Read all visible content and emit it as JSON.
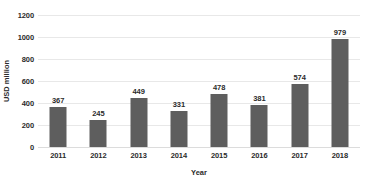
{
  "chart_data": {
    "type": "bar",
    "title": "",
    "subtitle": "",
    "xlabel": "Year",
    "ylabel": "USD million",
    "categories": [
      "2011",
      "2012",
      "2013",
      "2014",
      "2015",
      "2016",
      "2017",
      "2018"
    ],
    "values": [
      367,
      245,
      449,
      331,
      478,
      381,
      574,
      979
    ],
    "data_labels": [
      "367",
      "245",
      "449",
      "331",
      "478",
      "381",
      "574",
      "979"
    ],
    "ylim": [
      0,
      1200
    ],
    "yticks": [
      0,
      200,
      400,
      600,
      800,
      1000,
      1200
    ],
    "ytick_labels": [
      "0",
      "200",
      "400",
      "600",
      "800",
      "1000",
      "1200"
    ],
    "grid": "horizontal",
    "legend": "none",
    "series": [
      {
        "name": "USD million",
        "values": [
          367,
          245,
          449,
          331,
          478,
          381,
          574,
          979
        ]
      }
    ],
    "colors": {
      "bar": "#5e5e5e",
      "grid": "#e8e8e8",
      "axis": "#dcdcdc",
      "text": "#2b2b2b",
      "background": "#ffffff"
    }
  }
}
